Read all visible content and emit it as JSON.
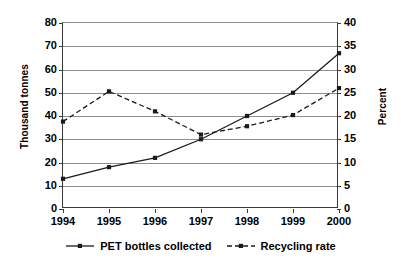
{
  "chart_data": {
    "type": "line",
    "title": "",
    "xlabel": "",
    "categories": [
      "1994",
      "1995",
      "1996",
      "1997",
      "1998",
      "1999",
      "2000"
    ],
    "grid": true,
    "legend_position": "bottom",
    "axes": {
      "left": {
        "label": "Thousand tonnes",
        "ticks": [
          "80",
          "70",
          "60",
          "50",
          "40",
          "30",
          "20",
          "10",
          "0"
        ],
        "tick_values": [
          80,
          70,
          60,
          50,
          40,
          30,
          20,
          10,
          0
        ],
        "min": 0,
        "max": 80,
        "step": 10
      },
      "right": {
        "label": "Percent",
        "ticks": [
          "40",
          "35",
          "30",
          "25",
          "20",
          "15",
          "10",
          "5",
          "0"
        ],
        "tick_values": [
          40,
          35,
          30,
          25,
          20,
          15,
          10,
          5,
          0
        ],
        "min": 0,
        "max": 40,
        "step": 5
      }
    },
    "series": [
      {
        "name": "PET bottles collected",
        "axis": "left",
        "style": "solid",
        "marker": "square",
        "color": "#1a1a1a",
        "values": [
          13,
          18,
          22,
          30,
          40,
          50,
          67
        ]
      },
      {
        "name": "Recycling rate",
        "axis": "right",
        "style": "dashed",
        "marker": "square",
        "color": "#1a1a1a",
        "values": [
          18.8,
          25.3,
          21.0,
          16.0,
          17.8,
          20.2,
          26.0
        ]
      }
    ]
  },
  "legend": {
    "items": [
      {
        "label": "PET bottles collected"
      },
      {
        "label": "Recycling rate"
      }
    ]
  }
}
